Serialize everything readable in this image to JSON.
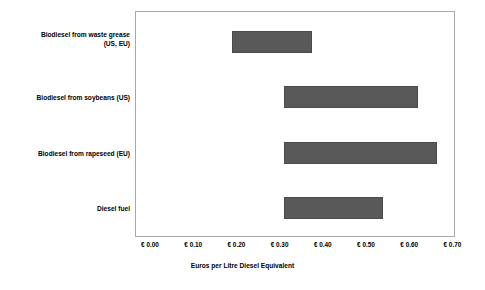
{
  "chart_data": {
    "type": "bar",
    "orientation": "horizontal",
    "bar_style": "floating-range",
    "title": "",
    "subtitle": "",
    "xlabel": "Euros per Litre Diesel Equivalent",
    "ylabel": "",
    "xlim": [
      0.0,
      0.7
    ],
    "xticks": [
      0.0,
      0.1,
      0.2,
      0.3,
      0.4,
      0.5,
      0.6,
      0.7
    ],
    "xtick_labels": [
      "€ 0.00",
      "€ 0.10",
      "€ 0.20",
      "€ 0.30",
      "€ 0.40",
      "€ 0.50",
      "€ 0.60",
      "€ 0.70"
    ],
    "grid": false,
    "legend": null,
    "legend_position": "none",
    "bar_color": "#595959",
    "plot_border_color": "#a8a8a8",
    "background_color": "#ffffff",
    "categories": [
      "Biodiesel from waste grease (US, EU)",
      "Biodiesel from soybeans (US)",
      "Biodiesel from rapeseed (EU)",
      "Diesel fuel"
    ],
    "category_label_lines": [
      [
        "Biodiesel from waste grease",
        "(US, EU)"
      ],
      [
        "Biodiesel from soybeans (US)"
      ],
      [
        "Biodiesel from rapeseed (EU)"
      ],
      [
        "Diesel fuel"
      ]
    ],
    "ranges": [
      {
        "category": "Biodiesel from waste grease (US, EU)",
        "low": 0.19,
        "high": 0.375
      },
      {
        "category": "Biodiesel from soybeans (US)",
        "low": 0.31,
        "high": 0.62
      },
      {
        "category": "Biodiesel from rapeseed (EU)",
        "low": 0.31,
        "high": 0.665
      },
      {
        "category": "Diesel fuel",
        "low": 0.31,
        "high": 0.54
      }
    ],
    "series": [
      {
        "name": "low",
        "values": [
          0.19,
          0.31,
          0.31,
          0.31
        ]
      },
      {
        "name": "high",
        "values": [
          0.375,
          0.62,
          0.665,
          0.54
        ]
      }
    ],
    "annotations": []
  }
}
